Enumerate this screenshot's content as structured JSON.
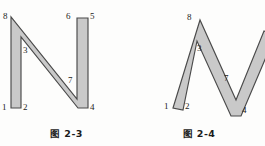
{
  "page": {
    "background_color": "#fdfdfc",
    "ink_color": "#1d1d1d"
  },
  "style": {
    "fill_color": "#c9c9c9",
    "outline_color": "#4a4a4a"
  },
  "figures": [
    {
      "id": "figure-2-3",
      "caption": "图 2-3",
      "description": "upright block letter N outline with numbered vertices",
      "vertex_labels": [
        {
          "text": "8",
          "x": 3,
          "y": 12
        },
        {
          "text": "6",
          "x": 66,
          "y": 12
        },
        {
          "text": "5",
          "x": 88,
          "y": 12
        },
        {
          "text": "3",
          "x": 21,
          "y": 46
        },
        {
          "text": "7",
          "x": 69,
          "y": 77
        },
        {
          "text": "1",
          "x": 2,
          "y": 104
        },
        {
          "text": "2",
          "x": 21,
          "y": 104
        },
        {
          "text": "4",
          "x": 89,
          "y": 104
        }
      ]
    },
    {
      "id": "figure-2-4",
      "caption": "图 2-4",
      "description": "slanted italic block letter N outline, cropped at right edge",
      "vertex_labels": [
        {
          "text": "8",
          "x": 54,
          "y": 14
        },
        {
          "text": "3",
          "x": 64,
          "y": 45
        },
        {
          "text": "7",
          "x": 91,
          "y": 74
        },
        {
          "text": "1",
          "x": 32,
          "y": 103
        },
        {
          "text": "2",
          "x": 52,
          "y": 103
        },
        {
          "text": "4",
          "x": 108,
          "y": 106
        }
      ]
    }
  ]
}
